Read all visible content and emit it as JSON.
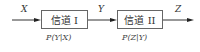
{
  "diagram": {
    "nodes": [
      {
        "id": "channel1",
        "label": "信道 I",
        "prob": "P(Y|X)"
      },
      {
        "id": "channel2",
        "label": "信道 II",
        "prob": "P(Z|Y)"
      }
    ],
    "edges": [
      {
        "from": "input",
        "to": "channel1",
        "label": "X"
      },
      {
        "from": "channel1",
        "to": "channel2",
        "label": "Y"
      },
      {
        "from": "channel2",
        "to": "output",
        "label": "Z"
      }
    ]
  }
}
